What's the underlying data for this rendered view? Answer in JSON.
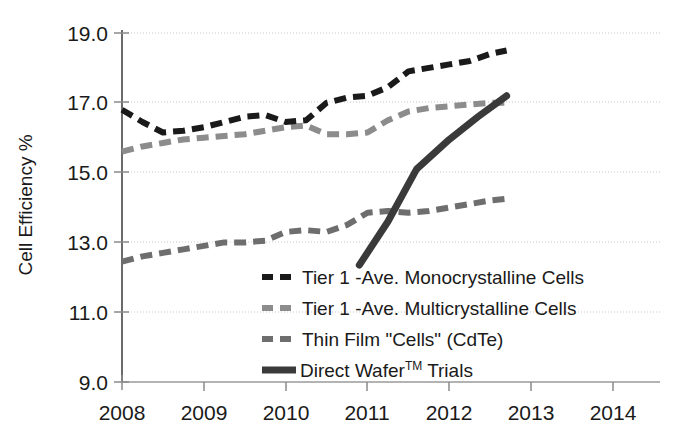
{
  "chart_data": {
    "type": "line",
    "title": "",
    "xlabel": "",
    "ylabel": "Cell Efficiency %",
    "xlim": [
      2008,
      2014
    ],
    "ylim": [
      9.0,
      19.0
    ],
    "grid": true,
    "legend_position": "inside-lower-right",
    "x_ticks": [
      "2008",
      "2009",
      "2010",
      "2011",
      "2012",
      "2013",
      "2014"
    ],
    "y_ticks": [
      "9.0",
      "11.0",
      "13.0",
      "15.0",
      "17.0",
      "19.0"
    ],
    "series": [
      {
        "name": "Tier 1 -Ave. Monocrystalline Cells",
        "style": "dashed",
        "color": "#1a1a1a",
        "x": [
          2008.0,
          2008.25,
          2008.5,
          2008.75,
          2009.0,
          2009.25,
          2009.5,
          2009.75,
          2010.0,
          2010.25,
          2010.5,
          2010.75,
          2011.0,
          2011.25,
          2011.5,
          2011.75,
          2012.0,
          2012.25,
          2012.5,
          2012.7
        ],
        "y": [
          16.8,
          16.45,
          16.15,
          16.2,
          16.3,
          16.45,
          16.6,
          16.65,
          16.45,
          16.5,
          17.0,
          17.15,
          17.2,
          17.45,
          17.9,
          18.0,
          18.1,
          18.2,
          18.4,
          18.5
        ]
      },
      {
        "name": "Tier 1 -Ave. Multicrystalline Cells",
        "style": "dashed",
        "color": "#8c8c8c",
        "x": [
          2008.0,
          2008.25,
          2008.5,
          2008.75,
          2009.0,
          2009.25,
          2009.5,
          2009.75,
          2010.0,
          2010.25,
          2010.5,
          2010.75,
          2011.0,
          2011.25,
          2011.5,
          2011.75,
          2012.0,
          2012.25,
          2012.5,
          2012.7
        ],
        "y": [
          15.6,
          15.75,
          15.85,
          15.95,
          16.0,
          16.05,
          16.1,
          16.2,
          16.3,
          16.35,
          16.1,
          16.1,
          16.15,
          16.5,
          16.75,
          16.85,
          16.9,
          16.95,
          17.0,
          17.0
        ]
      },
      {
        "name": "Thin Film \"Cells\" (CdTe)",
        "style": "dashed",
        "color": "#6e6e6e",
        "x": [
          2008.0,
          2008.25,
          2008.5,
          2008.75,
          2009.0,
          2009.25,
          2009.5,
          2009.75,
          2010.0,
          2010.25,
          2010.5,
          2010.75,
          2011.0,
          2011.25,
          2011.5,
          2011.75,
          2012.0,
          2012.25,
          2012.5,
          2012.7
        ],
        "y": [
          12.45,
          12.6,
          12.7,
          12.8,
          12.9,
          13.0,
          13.0,
          13.05,
          13.3,
          13.35,
          13.3,
          13.5,
          13.85,
          13.9,
          13.85,
          13.9,
          14.0,
          14.1,
          14.2,
          14.25
        ]
      },
      {
        "name": "Direct Wafer™ Trials",
        "style": "solid",
        "color": "#3a3a3a",
        "x": [
          2010.9,
          2011.25,
          2011.6,
          2012.0,
          2012.35,
          2012.7
        ],
        "y": [
          12.35,
          13.6,
          15.1,
          15.95,
          16.6,
          17.2
        ]
      }
    ]
  },
  "legend": {
    "items": [
      {
        "label": "Tier 1 -Ave. Monocrystalline Cells",
        "style": "dashed",
        "color": "#1a1a1a"
      },
      {
        "label": "Tier 1 -Ave. Multicrystalline Cells",
        "style": "dashed",
        "color": "#8c8c8c"
      },
      {
        "label": "Thin Film \"Cells\" (CdTe)",
        "style": "dashed",
        "color": "#6e6e6e"
      },
      {
        "label_pre": "Direct Wafer",
        "label_sup": "TM",
        "label_post": " Trials",
        "style": "solid",
        "color": "#3a3a3a"
      }
    ]
  },
  "colors": {
    "axis": "#6b6b6b",
    "grid": "#c9c9c9",
    "text": "#1a1a1a",
    "background": "#ffffff"
  }
}
